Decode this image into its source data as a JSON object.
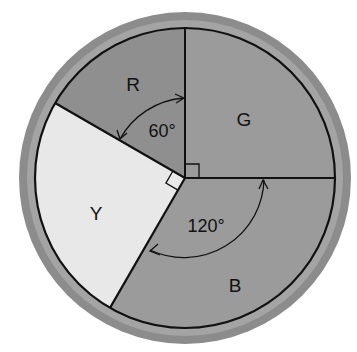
{
  "diagram": {
    "type": "circle-sector-diagram",
    "sectors": [
      {
        "id": "R",
        "label": "R",
        "start_deg": 90,
        "end_deg": 150,
        "color": "#8e8e8e"
      },
      {
        "id": "G",
        "label": "G",
        "start_deg": 0,
        "end_deg": 90,
        "color": "#9a9a9a"
      },
      {
        "id": "Y",
        "label": "Y",
        "start_deg": 150,
        "end_deg": 240,
        "color": "#e6e6e6"
      },
      {
        "id": "B",
        "label": "B",
        "start_deg": 240,
        "end_deg": 360,
        "color": "#9a9a9a"
      }
    ],
    "angle_labels": {
      "r_angle": "60°",
      "b_angle": "120°"
    },
    "right_angle_marks": [
      "G",
      "Y"
    ],
    "ring_color": "#8a8a8a"
  }
}
